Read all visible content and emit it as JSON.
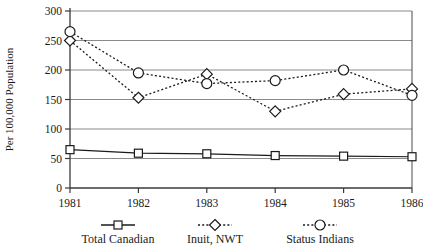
{
  "chart_data": {
    "type": "line",
    "title": "",
    "xlabel": "",
    "ylabel": "Per 100,000 Population",
    "categories": [
      "1981",
      "1982",
      "1983",
      "1984",
      "1985",
      "1986"
    ],
    "x": [
      1981,
      1982,
      1983,
      1984,
      1985,
      1986
    ],
    "ylim": [
      0,
      300
    ],
    "yticks": [
      0,
      50,
      100,
      150,
      200,
      250,
      300
    ],
    "ytick_labels": [
      "0",
      "50",
      "100",
      "150",
      "200",
      "250",
      "300"
    ],
    "grid": "horizontal",
    "legend_position": "bottom",
    "series": [
      {
        "name": "Total Canadian",
        "marker": "square",
        "line_style": "solid",
        "color": "#1a1a1a",
        "values": [
          65,
          59,
          58,
          55,
          54,
          53
        ]
      },
      {
        "name": "Inuit, NWT",
        "marker": "diamond",
        "line_style": "dotted",
        "color": "#1a1a1a",
        "values": [
          250,
          153,
          193,
          130,
          159,
          168
        ]
      },
      {
        "name": "Status Indians",
        "marker": "circle",
        "line_style": "dotted",
        "color": "#1a1a1a",
        "values": [
          265,
          195,
          177,
          182,
          200,
          157
        ]
      }
    ]
  },
  "axis": {
    "y_title": "Per 100,000 Population"
  },
  "legend": {
    "items": [
      {
        "label": "Total Canadian",
        "marker": "square-marker",
        "style": "solid"
      },
      {
        "label": "Inuit, NWT",
        "marker": "diamond-marker",
        "style": "dotted"
      },
      {
        "label": "Status Indians",
        "marker": "circle-marker",
        "style": "dotted"
      }
    ]
  }
}
